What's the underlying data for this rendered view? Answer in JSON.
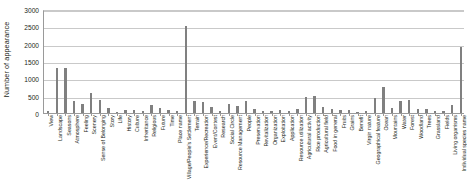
{
  "chart_data": {
    "type": "bar",
    "title": "",
    "xlabel": "",
    "ylabel": "Number of appearance",
    "ylim": [
      0,
      3000
    ],
    "yticks": [
      0,
      500,
      1000,
      1500,
      2000,
      2500,
      3000
    ],
    "ytick_labels": [
      "0",
      "500",
      "1000",
      "1500",
      "2000",
      "2500",
      "3000"
    ],
    "grid": true,
    "legend": "none",
    "bar_color": "#808080",
    "categories": [
      "View",
      "Landscape",
      "Seasons",
      "Atmosphere",
      "Feeling",
      "Scenery",
      "Sense of Belonging",
      "Story",
      "Life",
      "History",
      "Culture",
      "Inheritance",
      "Religious",
      "Future",
      "Time",
      "Place name",
      "Village/People's Settlement",
      "Terrain",
      "Experience/Recreation",
      "Event/Contest",
      "Research",
      "Social Circle",
      "Resource Management",
      "People",
      "Preservation",
      "Revitalization",
      "Organization",
      "Exploitation",
      "Application",
      "Resource utilization",
      "Agricultural activity",
      "Rice production",
      "Agricultural field",
      "Food in general",
      "Fruits",
      "Grains",
      "Benefit",
      "Virgin nature",
      "Geographical feature",
      "Ocean",
      "Mountains",
      "Water",
      "Forest",
      "Woodland",
      "Trees",
      "Grassland",
      "Fields",
      "Living organisms",
      "Individual species name"
    ],
    "values": [
      70,
      1300,
      1290,
      350,
      270,
      590,
      380,
      150,
      30,
      90,
      80,
      70,
      240,
      150,
      100,
      50,
      2500,
      360,
      310,
      180,
      60,
      270,
      200,
      350,
      130,
      70,
      70,
      100,
      60,
      120,
      450,
      490,
      160,
      130,
      90,
      80,
      40,
      70,
      420,
      760,
      140,
      360,
      370,
      120,
      110,
      70,
      70,
      230,
      1900
    ]
  }
}
